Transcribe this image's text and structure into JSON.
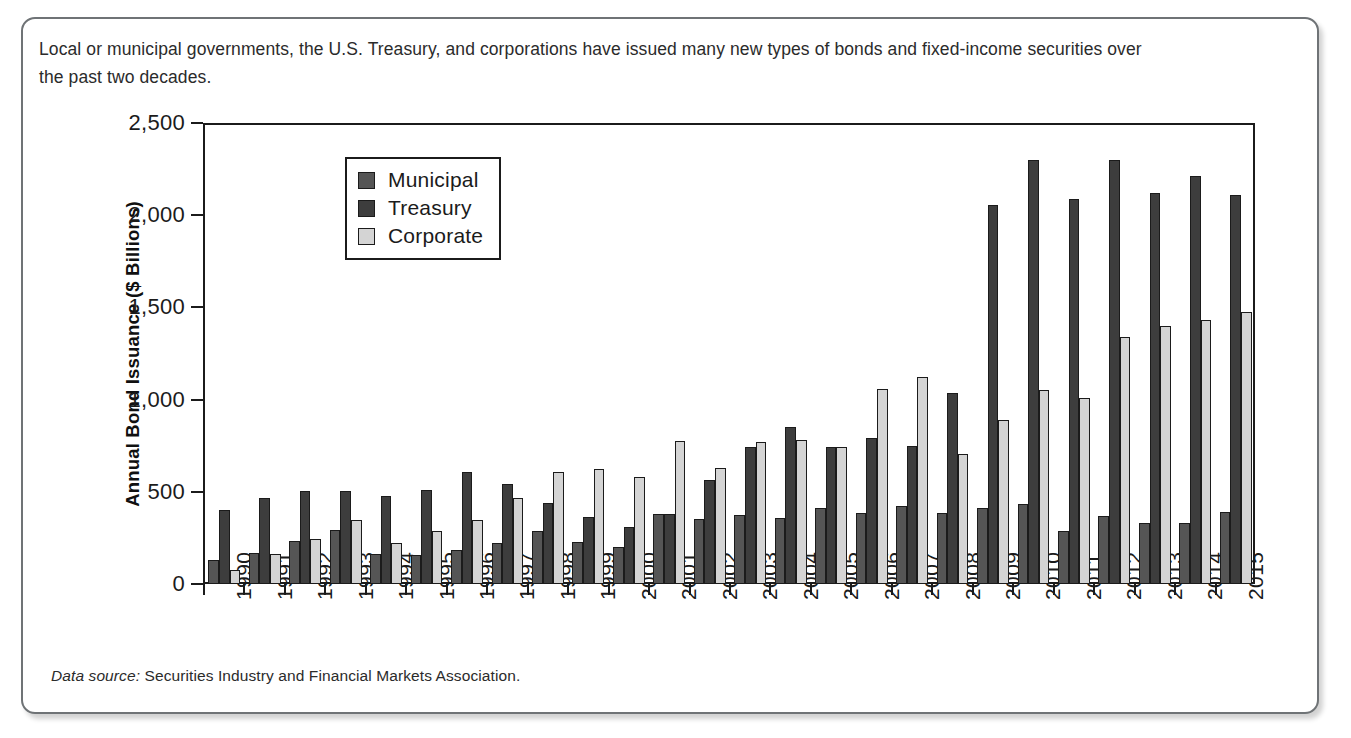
{
  "caption": "Local or municipal governments, the U.S. Treasury, and corporations have issued many new types of bonds and fixed-income securities over the past two decades.",
  "source_note": {
    "label": "Data source:",
    "text": " Securities Industry and Financial Markets Association."
  },
  "colors": {
    "municipal": "#555555",
    "treasury": "#3d3d3d",
    "corporate": "#d4d4d4",
    "axis": "#1b1b1b",
    "frame_border": "#6f7376",
    "text": "#2b2b2b"
  },
  "chart_data": {
    "type": "bar",
    "title": "",
    "xlabel": "",
    "ylabel": "Annual Bond Issuance ($ Billions)",
    "ylim": [
      0,
      2500
    ],
    "yticks": [
      0,
      500,
      1000,
      1500,
      2000,
      2500
    ],
    "ytick_labels": [
      "0",
      "500",
      "1,000",
      "1,500",
      "2,000",
      "2,500"
    ],
    "grid": false,
    "legend_position": "upper left inside",
    "categories": [
      "1990",
      "1991",
      "1992",
      "1993",
      "1994",
      "1995",
      "1996",
      "1997",
      "1998",
      "1999",
      "2000",
      "2001",
      "2002",
      "2003",
      "2004",
      "2005",
      "2006",
      "2007",
      "2008",
      "2009",
      "2010",
      "2011",
      "2012",
      "2013",
      "2014",
      "2015"
    ],
    "series": [
      {
        "name": "Municipal",
        "color": "#555555",
        "values": [
          130,
          170,
          235,
          295,
          165,
          160,
          185,
          220,
          285,
          230,
          200,
          380,
          355,
          375,
          360,
          410,
          385,
          425,
          385,
          410,
          435,
          290,
          370,
          330,
          330,
          390
        ]
      },
      {
        "name": "Treasury",
        "color": "#3d3d3d",
        "values": [
          400,
          465,
          505,
          505,
          480,
          510,
          610,
          540,
          440,
          365,
          310,
          380,
          565,
          745,
          850,
          745,
          790,
          750,
          1035,
          2055,
          2300,
          2090,
          2300,
          2120,
          2210,
          2110
        ]
      },
      {
        "name": "Corporate",
        "color": "#d4d4d4",
        "values": [
          75,
          165,
          245,
          345,
          225,
          285,
          345,
          465,
          610,
          625,
          580,
          775,
          630,
          770,
          780,
          745,
          1055,
          1120,
          705,
          890,
          1050,
          1010,
          1340,
          1400,
          1430,
          1475
        ]
      }
    ]
  }
}
